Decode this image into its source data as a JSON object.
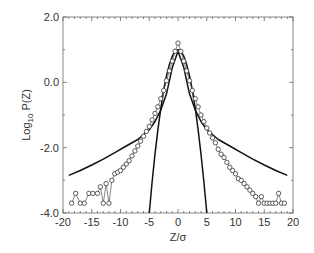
{
  "chart_data": {
    "type": "line",
    "title": "",
    "xlabel": "Z/σ",
    "ylabel": "Log10 P(Z)",
    "ylabel_parts": {
      "main": "Log",
      "sub": "10",
      "rest": " P(Z)"
    },
    "xlim": [
      -20,
      20
    ],
    "ylim": [
      -4.0,
      2.0
    ],
    "x_ticks": [
      -20,
      -15,
      -10,
      -5,
      0,
      5,
      10,
      15,
      20
    ],
    "x_tick_labels": [
      "-20",
      "-15",
      "-10",
      "-5",
      "0",
      "5",
      "10",
      "15",
      "20"
    ],
    "y_ticks": [
      2.0,
      0.0,
      -2.0,
      -4.0
    ],
    "y_tick_labels": [
      "2.0",
      "0.0",
      "-2.0",
      "-4.0"
    ],
    "grid": false,
    "legend": null,
    "series": [
      {
        "name": "Gaussian fit",
        "style": "solid line",
        "x": [
          -5.0,
          -4.5,
          -4.0,
          -3.5,
          -3.0,
          -2.5,
          -2.0,
          -1.5,
          -1.0,
          -0.5,
          0.0,
          0.5,
          1.0,
          1.5,
          2.0,
          2.5,
          3.0,
          3.5,
          4.0,
          4.5,
          5.0
        ],
        "y": [
          -4.0,
          -3.05,
          -2.2,
          -1.45,
          -0.8,
          -0.25,
          0.2,
          0.55,
          0.8,
          0.95,
          1.0,
          0.95,
          0.8,
          0.55,
          0.2,
          -0.25,
          -0.8,
          -1.45,
          -2.2,
          -3.05,
          -4.0
        ]
      },
      {
        "name": "Broad-tail fit",
        "style": "solid line",
        "x": [
          -19,
          -17,
          -15,
          -13,
          -11,
          -9,
          -7,
          -5,
          -4,
          -3,
          -2,
          -1,
          0,
          1,
          2,
          3,
          4,
          5,
          7,
          9,
          11,
          13,
          15,
          17,
          19
        ],
        "y": [
          -2.85,
          -2.7,
          -2.53,
          -2.35,
          -2.15,
          -1.95,
          -1.75,
          -1.45,
          -1.2,
          -0.85,
          -0.35,
          0.45,
          0.95,
          0.45,
          -0.35,
          -0.85,
          -1.2,
          -1.45,
          -1.75,
          -1.95,
          -2.15,
          -2.35,
          -2.53,
          -2.7,
          -2.85
        ]
      },
      {
        "name": "Data",
        "style": "open circles connected by thin line",
        "x": [
          -18.5,
          -17.8,
          -17.0,
          -16.3,
          -15.5,
          -14.8,
          -14.0,
          -13.5,
          -13.0,
          -12.5,
          -12.0,
          -11.5,
          -11.0,
          -10.5,
          -10.0,
          -9.5,
          -9.0,
          -8.5,
          -8.0,
          -7.5,
          -7.0,
          -6.5,
          -6.0,
          -5.5,
          -5.0,
          -4.5,
          -4.0,
          -3.5,
          -3.0,
          -2.5,
          -2.0,
          -1.5,
          -1.0,
          -0.5,
          0.0,
          0.5,
          1.0,
          1.5,
          2.0,
          2.5,
          3.0,
          3.5,
          4.0,
          4.5,
          5.0,
          5.5,
          6.0,
          6.5,
          7.0,
          7.5,
          8.0,
          8.5,
          9.0,
          9.5,
          10.0,
          10.5,
          11.0,
          11.5,
          12.0,
          12.5,
          13.0,
          13.5,
          14.0,
          14.5,
          15.0,
          15.5,
          16.0,
          16.5,
          17.0,
          17.5,
          18.0,
          18.5
        ],
        "y": [
          -3.7,
          -3.4,
          -3.7,
          -3.7,
          -3.4,
          -3.4,
          -3.4,
          -3.2,
          -3.7,
          -3.1,
          -3.7,
          -3.0,
          -2.8,
          -2.75,
          -2.7,
          -2.6,
          -2.5,
          -2.4,
          -2.25,
          -2.1,
          -1.95,
          -1.8,
          -1.65,
          -1.5,
          -1.35,
          -1.15,
          -0.95,
          -0.75,
          -0.5,
          -0.25,
          0.05,
          0.35,
          0.65,
          0.95,
          1.2,
          0.95,
          0.65,
          0.35,
          0.05,
          -0.25,
          -0.5,
          -0.75,
          -1.0,
          -1.2,
          -1.4,
          -1.55,
          -1.7,
          -1.85,
          -2.05,
          -2.2,
          -2.3,
          -2.45,
          -2.6,
          -2.7,
          -2.8,
          -2.95,
          -3.0,
          -3.1,
          -3.2,
          -3.3,
          -3.4,
          -3.5,
          -3.7,
          -3.5,
          -3.7,
          -3.7,
          -3.7,
          -3.7,
          -3.7,
          -3.4,
          -3.7,
          -3.7
        ]
      }
    ]
  }
}
